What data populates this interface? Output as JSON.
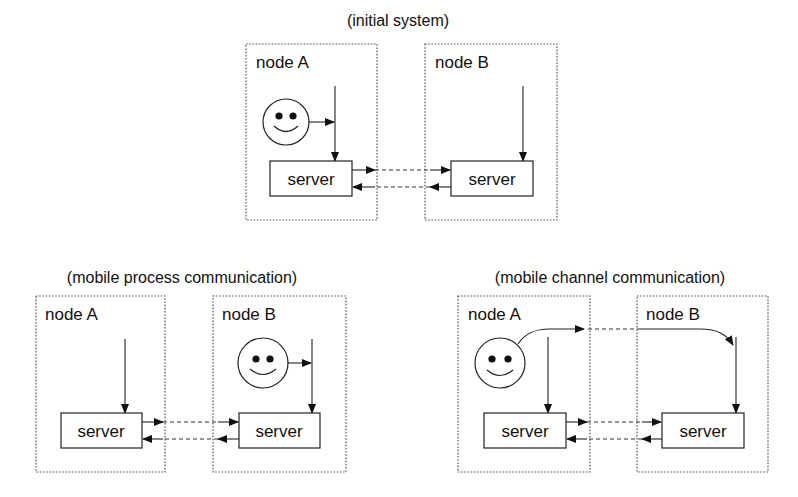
{
  "panels": {
    "top": {
      "title": "(initial system)",
      "node_a": {
        "label": "node A",
        "server": "server",
        "has_process": true
      },
      "node_b": {
        "label": "node B",
        "server": "server",
        "has_process": false
      }
    },
    "bottom_left": {
      "title": "(mobile process communication)",
      "node_a": {
        "label": "node A",
        "server": "server",
        "has_process": false
      },
      "node_b": {
        "label": "node B",
        "server": "server",
        "has_process": true
      }
    },
    "bottom_right": {
      "title": "(mobile channel communication)",
      "node_a": {
        "label": "node A",
        "server": "server",
        "has_process": true
      },
      "node_b": {
        "label": "node B",
        "server": "server",
        "has_process": false
      }
    }
  },
  "icons": {
    "process": "smiley-face-icon",
    "arrow": "arrowhead-icon"
  }
}
